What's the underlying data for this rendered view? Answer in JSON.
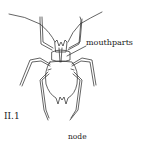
{
  "figure": {
    "labels": {
      "mouthparts": "mouthparts",
      "figure_number": "II.1",
      "node": "node"
    },
    "colors": {
      "line": "#222222",
      "background": "#ffffff"
    }
  }
}
